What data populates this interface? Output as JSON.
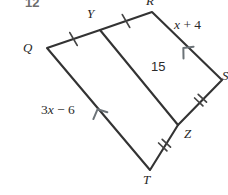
{
  "figure": {
    "problem_number": "12",
    "type": "geometry-diagram",
    "stroke_color": "#333333",
    "text_color": "#2b2b2b",
    "background_color": "#ffffff",
    "vertices": [
      {
        "name": "Q",
        "label": "Q",
        "x": 47,
        "y": 48,
        "label_x": 25,
        "label_y": 41
      },
      {
        "name": "Y",
        "label": "Y",
        "x": 100,
        "y": 30,
        "label_x": 86,
        "label_y": 8
      },
      {
        "name": "R",
        "label": "R",
        "x": 152,
        "y": 12,
        "label_x": 146,
        "label_y": -6
      },
      {
        "name": "S",
        "label": "S",
        "x": 222,
        "y": 80,
        "label_x": 221,
        "label_y": 70
      },
      {
        "name": "Z",
        "label": "Z",
        "x": 178,
        "y": 125,
        "label_x": 183,
        "label_y": 128
      },
      {
        "name": "T",
        "label": "T",
        "x": 150,
        "y": 170,
        "label_x": 144,
        "label_y": 172
      }
    ],
    "segments": [
      {
        "name": "segment-QY",
        "from": "Q",
        "to": "Y",
        "ticks": 1
      },
      {
        "name": "segment-YR",
        "from": "Y",
        "to": "R",
        "ticks": 1
      },
      {
        "name": "segment-RS",
        "from": "R",
        "to": "S",
        "ticks": 0,
        "arrow": 1
      },
      {
        "name": "segment-SZ",
        "from": "S",
        "to": "Z",
        "ticks": 2
      },
      {
        "name": "segment-ZT",
        "from": "Z",
        "to": "T",
        "ticks": 2
      },
      {
        "name": "segment-TQ",
        "from": "T",
        "to": "Q",
        "ticks": 0,
        "arrow": 1
      },
      {
        "name": "segment-YZ",
        "from": "Y",
        "to": "Z",
        "ticks": 0,
        "arrow": 0
      }
    ],
    "measure_labels": [
      {
        "name": "label-x-plus-4",
        "text": "x + 4",
        "html": "<i>x</i> + 4",
        "x": 172,
        "y": 25,
        "side": "RS"
      },
      {
        "name": "label-15",
        "text": "15",
        "x": 152,
        "y": 60,
        "side": "YZ"
      },
      {
        "name": "label-3x-minus-6",
        "text": "3x − 6",
        "html": "3<i>x</i> − 6",
        "x": 42,
        "y": 104,
        "side": "TQ"
      }
    ]
  }
}
